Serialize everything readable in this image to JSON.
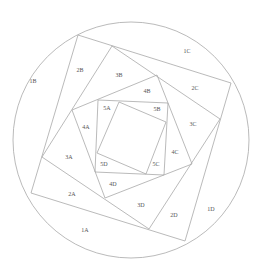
{
  "diagram": {
    "title": "",
    "type": "nested rotated squares inscribed in circle (log-cabin / pineapple spiral)",
    "stroke_color": "#a8a8a8",
    "label_color": "#555555",
    "circle": {
      "cx": 131,
      "cy": 140,
      "r": 118
    },
    "squares": [
      {
        "name": "square-1",
        "points": "78,35 231,83 185,241 31,193"
      },
      {
        "name": "square-2",
        "points": "112,46 220,119 149,229 42,157"
      },
      {
        "name": "square-3",
        "points": "157,75 192,164 105,198 72,110"
      },
      {
        "name": "square-4",
        "points": "98,100 168,103 164,175 95,172"
      },
      {
        "name": "square-5",
        "points": "119,102 166,122 146,174 97,153"
      }
    ],
    "labels": [
      {
        "text": "1A",
        "x": 85,
        "y": 231
      },
      {
        "text": "1B",
        "x": 33,
        "y": 82
      },
      {
        "text": "1C",
        "x": 187,
        "y": 52
      },
      {
        "text": "1D",
        "x": 211,
        "y": 210
      },
      {
        "text": "2A",
        "x": 72,
        "y": 195
      },
      {
        "text": "2B",
        "x": 80,
        "y": 71
      },
      {
        "text": "2C",
        "x": 195,
        "y": 89
      },
      {
        "text": "2D",
        "x": 174,
        "y": 216
      },
      {
        "text": "3A",
        "x": 69,
        "y": 158
      },
      {
        "text": "3B",
        "x": 119,
        "y": 76
      },
      {
        "text": "3C",
        "x": 193,
        "y": 125
      },
      {
        "text": "3D",
        "x": 141,
        "y": 206
      },
      {
        "text": "4A",
        "x": 86,
        "y": 128
      },
      {
        "text": "4B",
        "x": 147,
        "y": 92
      },
      {
        "text": "4C",
        "x": 175,
        "y": 153
      },
      {
        "text": "4D",
        "x": 113,
        "y": 185
      },
      {
        "text": "5A",
        "x": 107,
        "y": 109
      },
      {
        "text": "5B",
        "x": 157,
        "y": 110
      },
      {
        "text": "5C",
        "x": 156,
        "y": 165
      },
      {
        "text": "5D",
        "x": 104,
        "y": 165
      }
    ]
  }
}
